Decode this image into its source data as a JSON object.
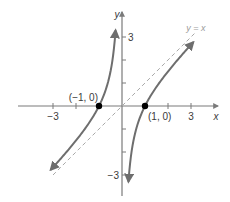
{
  "chart_data": {
    "type": "line",
    "title": "",
    "function": "f(x) = x - 1/x",
    "xlabel": "x",
    "ylabel": "y",
    "xlim": [
      -4.8,
      4.8
    ],
    "ylim": [
      -4.2,
      4.2
    ],
    "x_ticks": [
      -3,
      -2,
      -1,
      1,
      2,
      3
    ],
    "y_ticks": [
      -3,
      -2,
      -1,
      1,
      2,
      3
    ],
    "x_tick_labels": [
      {
        "value": -3,
        "label": "−3"
      },
      {
        "value": 3,
        "label": "3"
      }
    ],
    "y_tick_labels": [
      {
        "value": 3,
        "label": "3"
      },
      {
        "value": -3,
        "label": "−3"
      }
    ],
    "grid": false,
    "series": [
      {
        "name": "left-branch",
        "x_range": [
          -3.1,
          -0.28
        ],
        "arrows": "both"
      },
      {
        "name": "right-branch",
        "x_range": [
          0.28,
          3.1
        ],
        "arrows": "both"
      }
    ],
    "asymptote": {
      "label": "y = x",
      "slope": 1,
      "intercept": 0,
      "x_range": [
        -3.0,
        3.2
      ]
    },
    "points": [
      {
        "x": -1,
        "y": 0,
        "label": "(−1, 0)"
      },
      {
        "x": 1,
        "y": 0,
        "label": "(1, 0)"
      }
    ]
  }
}
